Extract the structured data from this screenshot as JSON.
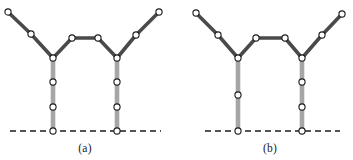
{
  "figure": {
    "width": 353,
    "height": 160,
    "background": "#ffffff"
  },
  "style": {
    "arm_color": "#4a4a4a",
    "arm_width": 3.6,
    "leg_color": "#a6a6a6",
    "leg_width": 4.6,
    "node_fill": "#ffffff",
    "node_stroke": "#1c1c1c",
    "node_stroke_width": 1.1,
    "node_radius": 3.1,
    "baseline_color": "#1c1c1c",
    "baseline_width": 1.3,
    "baseline_dash": "6,4",
    "caption_color": "#1a1a1a"
  },
  "panels": [
    {
      "id": "panel-a",
      "caption": "(a)",
      "caption_x": 85,
      "caption_y": 152,
      "baseline": {
        "x1": 10,
        "x2": 161,
        "y": 131
      },
      "arm_path": "8,12 31,34 53,58 72,38 98,38 117,58 136,35 159,12",
      "legs": [
        {
          "id": "left-leg",
          "x": 53,
          "y_top": 58,
          "y_bottom": 131
        },
        {
          "id": "right-leg",
          "x": 117,
          "y_top": 58,
          "y_bottom": 131
        }
      ],
      "nodes": [
        {
          "id": "a-left-arm-tip",
          "x": 8,
          "y": 12
        },
        {
          "id": "a-left-arm-mid",
          "x": 31,
          "y": 34
        },
        {
          "id": "a-left-junction",
          "x": 53,
          "y": 58
        },
        {
          "id": "a-plateau-left",
          "x": 72,
          "y": 38
        },
        {
          "id": "a-plateau-right",
          "x": 98,
          "y": 38
        },
        {
          "id": "a-right-junction",
          "x": 117,
          "y": 58
        },
        {
          "id": "a-right-arm-mid",
          "x": 136,
          "y": 35
        },
        {
          "id": "a-right-arm-tip",
          "x": 159,
          "y": 12
        },
        {
          "id": "a-left-leg-upper",
          "x": 53,
          "y": 82
        },
        {
          "id": "a-left-leg-lower",
          "x": 53,
          "y": 107
        },
        {
          "id": "a-left-leg-base",
          "x": 53,
          "y": 131
        },
        {
          "id": "a-right-leg-upper",
          "x": 117,
          "y": 82
        },
        {
          "id": "a-right-leg-lower",
          "x": 117,
          "y": 107
        },
        {
          "id": "a-right-leg-base",
          "x": 117,
          "y": 131
        }
      ]
    },
    {
      "id": "panel-b",
      "caption": "(b)",
      "caption_x": 270,
      "caption_y": 152,
      "baseline": {
        "x1": 205,
        "x2": 340,
        "y": 131
      },
      "arm_path": "196,13 218,35 238,58 256,38 285,38 302,58 322,35 342,14",
      "legs": [
        {
          "id": "left-leg",
          "x": 238,
          "y_top": 58,
          "y_bottom": 131
        },
        {
          "id": "right-leg",
          "x": 302,
          "y_top": 58,
          "y_bottom": 131
        }
      ],
      "nodes": [
        {
          "id": "b-left-arm-tip",
          "x": 196,
          "y": 13
        },
        {
          "id": "b-left-arm-mid",
          "x": 218,
          "y": 35
        },
        {
          "id": "b-left-junction",
          "x": 238,
          "y": 58
        },
        {
          "id": "b-plateau-left",
          "x": 256,
          "y": 38
        },
        {
          "id": "b-plateau-right",
          "x": 285,
          "y": 38
        },
        {
          "id": "b-right-junction",
          "x": 302,
          "y": 58
        },
        {
          "id": "b-right-arm-mid",
          "x": 322,
          "y": 35
        },
        {
          "id": "b-right-arm-tip",
          "x": 342,
          "y": 14
        },
        {
          "id": "b-left-leg-mid",
          "x": 238,
          "y": 95
        },
        {
          "id": "b-left-leg-base",
          "x": 238,
          "y": 131
        },
        {
          "id": "b-right-leg-upper",
          "x": 302,
          "y": 82
        },
        {
          "id": "b-right-leg-lower",
          "x": 302,
          "y": 107
        },
        {
          "id": "b-right-leg-base",
          "x": 302,
          "y": 131
        }
      ]
    }
  ]
}
